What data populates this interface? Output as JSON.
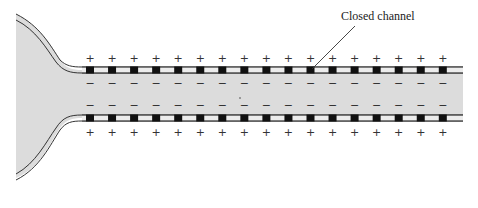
{
  "diagram": {
    "annotation": {
      "label": "Closed channel"
    },
    "outside_charge": "+",
    "inside_charge": "−",
    "channel_count": 17,
    "colors": {
      "cytoplasm": "#dcdcdc",
      "membrane_line": "#333333",
      "membrane_fill": "#e6e6e6",
      "channel": "#111111",
      "sign": "#333333"
    }
  }
}
